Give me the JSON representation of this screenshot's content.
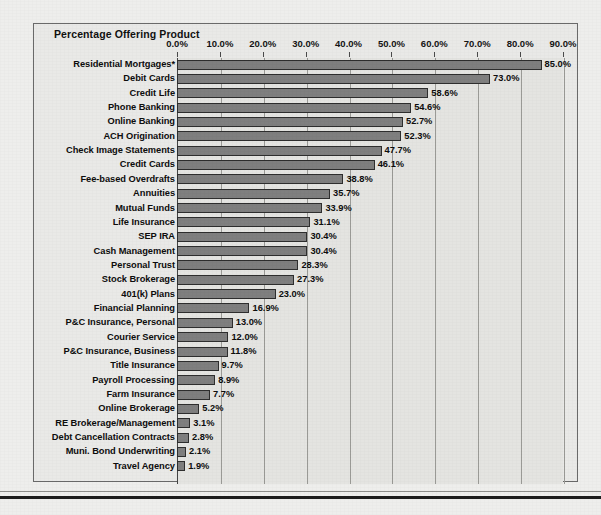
{
  "chart_data": {
    "type": "bar",
    "orientation": "horizontal",
    "title": "Percentage Offering Product",
    "xlabel": "",
    "ylabel": "",
    "xlim": [
      0,
      90
    ],
    "xtick_step": 10,
    "grid": true,
    "legend": "none",
    "value_label_suffix": "%",
    "xtick_labels": [
      "0.0%",
      "10.0%",
      "20.0%",
      "30.0%",
      "40.0%",
      "50.0%",
      "60.0%",
      "70.0%",
      "80.0%",
      "90.0%"
    ],
    "xticks": [
      0,
      10,
      20,
      30,
      40,
      50,
      60,
      70,
      80,
      90
    ],
    "categories": [
      "Residential Mortgages*",
      "Debit Cards",
      "Credit Life",
      "Phone Banking",
      "Online Banking",
      "ACH Origination",
      "Check Image Statements",
      "Credit Cards",
      "Fee-based Overdrafts",
      "Annuities",
      "Mutual Funds",
      "Life Insurance",
      "SEP IRA",
      "Cash Management",
      "Personal Trust",
      "Stock Brokerage",
      "401(k) Plans",
      "Financial Planning",
      "P&C Insurance, Personal",
      "Courier Service",
      "P&C Insurance, Business",
      "Title Insurance",
      "Payroll Processing",
      "Farm Insurance",
      "Online Brokerage",
      "RE Brokerage/Management",
      "Debt Cancellation Contracts",
      "Muni. Bond Underwriting",
      "Travel Agency"
    ],
    "values": [
      85.0,
      73.0,
      58.6,
      54.6,
      52.7,
      52.3,
      47.7,
      46.1,
      38.8,
      35.7,
      33.9,
      31.1,
      30.4,
      30.4,
      28.3,
      27.3,
      23.0,
      16.9,
      13.0,
      12.0,
      11.8,
      9.7,
      8.9,
      7.7,
      5.2,
      3.1,
      2.8,
      2.1,
      1.9
    ],
    "value_labels": [
      "85.0%",
      "73.0%",
      "58.6%",
      "54.6%",
      "52.7%",
      "52.3%",
      "47.7%",
      "46.1%",
      "38.8%",
      "35.7%",
      "33.9%",
      "31.1%",
      "30.4%",
      "30.4%",
      "28.3%",
      "27.3%",
      "23.0%",
      "16.9%",
      "13.0%",
      "12.0%",
      "11.8%",
      "9.7%",
      "8.9%",
      "7.7%",
      "5.2%",
      "3.1%",
      "2.8%",
      "2.1%",
      "1.9%"
    ],
    "colors": {
      "bar_fill": "#7f7f7f",
      "bar_border": "#2e2e2e",
      "plot_background": "#e4e4e1",
      "page_background": "#eeeeec",
      "gridline": "#9a9a96",
      "text": "#0d0d0d"
    }
  }
}
